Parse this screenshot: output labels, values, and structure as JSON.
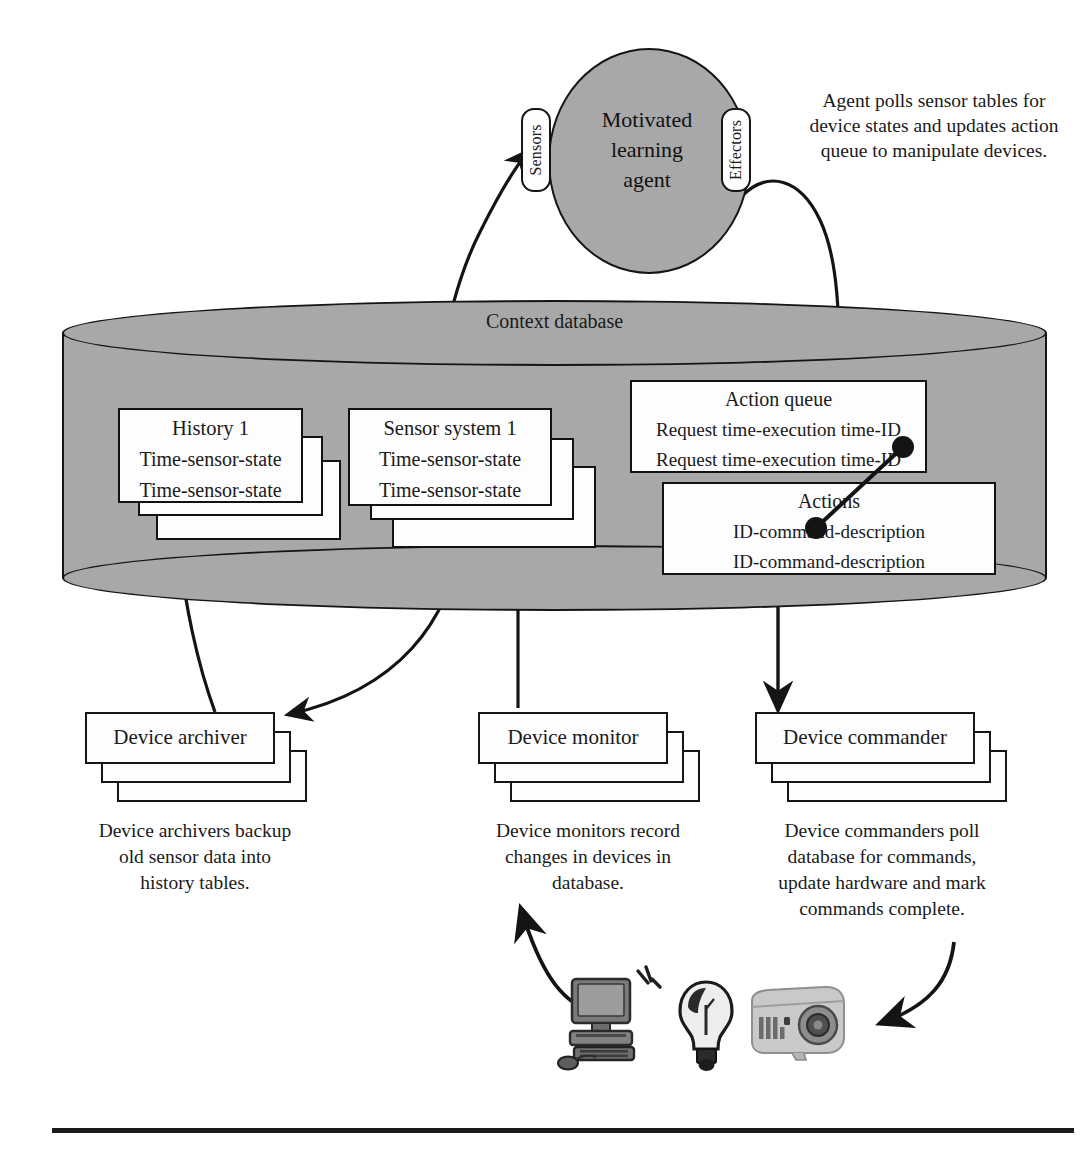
{
  "figure": {
    "colors": {
      "database_fill": "#a8a8a8",
      "agent_fill": "#a8a8a8",
      "stroke": "#151515",
      "card_fill": "#fdfdfd",
      "background": "#ffffff"
    }
  },
  "agent": {
    "label": "Motivated\nlearning\nagent",
    "label_lines": [
      "Motivated",
      "learning",
      "agent"
    ],
    "ports": {
      "sensors": "Sensors",
      "effectors": "Effectors"
    },
    "note": "Agent polls sensor tables for device states and updates action queue to manipulate devices."
  },
  "database": {
    "label": "Context database",
    "tables": {
      "history": {
        "title": "History 1",
        "rows": [
          "Time-sensor-state",
          "Time-sensor-state"
        ],
        "back_row_1": "Time-sensor-state",
        "back_row_2": "Time-sensor-state",
        "stack_count": 3
      },
      "sensor_system": {
        "title": "Sensor system 1",
        "rows": [
          "Time-sensor-state",
          "Time-sensor-state"
        ],
        "back_row_1": "Time-sensor-state",
        "back_row_2": "Time-sensor-state",
        "stack_count": 3
      },
      "action_queue": {
        "title": "Action queue",
        "rows": [
          "Request time-execution time-ID",
          "Request time-execution time-ID"
        ]
      },
      "actions": {
        "title": "Actions",
        "rows": [
          "ID-command-description",
          "ID-command-description"
        ]
      }
    }
  },
  "components": [
    {
      "id": "device-archiver",
      "label": "Device archiver",
      "caption": "Device archivers backup old sensor data into history tables.",
      "caption_lines": [
        "Device archivers backup",
        "old sensor data into",
        "history tables."
      ],
      "stack_count": 3
    },
    {
      "id": "device-monitor",
      "label": "Device monitor",
      "caption": "Device monitors record changes in devices in database.",
      "caption_lines": [
        "Device monitors record",
        "changes in devices in",
        "database."
      ],
      "stack_count": 3
    },
    {
      "id": "device-commander",
      "label": "Device commander",
      "caption": "Device commanders poll database for commands, update hardware and mark commands complete.",
      "caption_lines": [
        "Device commanders poll",
        "database for commands,",
        "update hardware and mark",
        "commands complete."
      ],
      "stack_count": 3
    }
  ],
  "devices": [
    {
      "id": "computer",
      "icon": "desktop-computer-icon"
    },
    {
      "id": "lightbulb",
      "icon": "light-bulb-icon"
    },
    {
      "id": "projector",
      "icon": "projector-icon"
    }
  ],
  "connectors": [
    {
      "id": "sensor-system-to-sensors",
      "from": "sensor-system-table",
      "to": "agent-sensors-port",
      "style": "curved-arrow"
    },
    {
      "id": "effectors-to-action-queue",
      "from": "agent-effectors-port",
      "to": "action-queue-table",
      "style": "curved-arrow"
    },
    {
      "id": "action-queue-to-actions",
      "from": "action-queue-table",
      "to": "actions-table",
      "style": "ball-and-stick-relation"
    },
    {
      "id": "action-queue-to-commander",
      "from": "action-queue-table",
      "to": "device-commander",
      "style": "straight-arrow"
    },
    {
      "id": "archiver-to-history",
      "from": "device-archiver",
      "to": "history-table",
      "style": "curved-arrow"
    },
    {
      "id": "sensor-system-to-archiver",
      "from": "sensor-system-table",
      "to": "device-archiver",
      "style": "curved-arrow"
    },
    {
      "id": "monitor-to-sensor-system",
      "from": "device-monitor",
      "to": "sensor-system-table",
      "style": "straight-arrow"
    },
    {
      "id": "devices-to-monitor",
      "from": "devices",
      "to": "device-monitor",
      "style": "curved-arrow"
    },
    {
      "id": "commander-to-devices",
      "from": "device-commander",
      "to": "devices",
      "style": "curved-arrow"
    }
  ]
}
